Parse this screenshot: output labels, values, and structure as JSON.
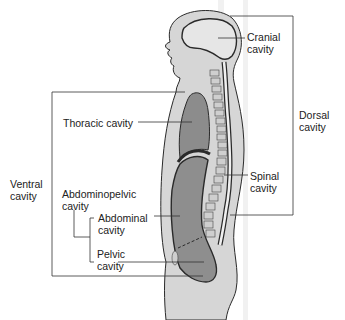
{
  "diagram": {
    "type": "anatomy-sagittal-body-cavities",
    "labels": {
      "cranial": "Cranial\ncavity",
      "thoracic": "Thoracic cavity",
      "dorsal": "Dorsal\ncavity",
      "spinal": "Spinal\ncavity",
      "ventral": "Ventral\ncavity",
      "abdominopelvic": "Abdominopelvic\ncavity",
      "abdominal": "Abdominal\ncavity",
      "pelvic": "Pelvic\ncavity"
    },
    "groups": [
      {
        "name": "Dorsal cavity",
        "members": [
          "Cranial cavity",
          "Spinal cavity"
        ]
      },
      {
        "name": "Ventral cavity",
        "members": [
          "Thoracic cavity",
          "Abdominopelvic cavity"
        ]
      },
      {
        "name": "Abdominopelvic cavity",
        "members": [
          "Abdominal cavity",
          "Pelvic cavity"
        ]
      }
    ],
    "colors": {
      "skin": "#d6d6d6",
      "cavity_light": "#e4e4e4",
      "cavity_dark": "#8a8a8a",
      "outline": "#2a2a2a",
      "leader": "#333333",
      "background": "#ffffff"
    }
  }
}
